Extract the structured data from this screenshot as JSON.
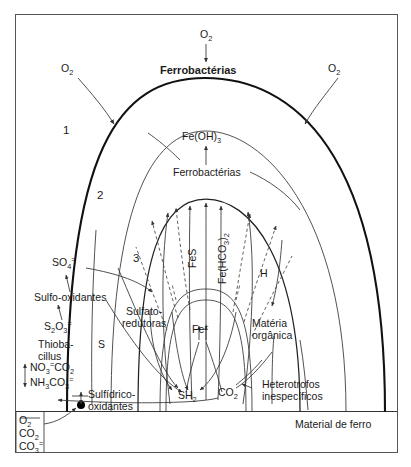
{
  "figure": {
    "title_label": "Ferrobactérias",
    "ground_label": "Material de ferro",
    "zones": [
      {
        "id": "zone-1",
        "label": "1"
      },
      {
        "id": "zone-2",
        "label": "2"
      },
      {
        "id": "zone-3",
        "label": "3"
      }
    ],
    "oxygen_inputs": [
      {
        "id": "o2-top",
        "label": "O",
        "sub": "2"
      },
      {
        "id": "o2-left",
        "label": "O",
        "sub": "2"
      },
      {
        "id": "o2-right",
        "label": "O",
        "sub": "2"
      }
    ],
    "species": [
      {
        "id": "fe-oh-3",
        "label": "Fe(OH)",
        "sub": "3"
      },
      {
        "id": "ferrobacterias-inner",
        "label": "Ferrobactérias"
      },
      {
        "id": "fes",
        "label": "FeS"
      },
      {
        "id": "fe-hco3-2",
        "label": "Fe(HCO",
        "sub": "3",
        "tail": ")",
        "sub2": "2"
      },
      {
        "id": "hydrogen",
        "label": "H"
      },
      {
        "id": "sulfate-ion",
        "label": "SO",
        "sub": "4",
        "sup": "="
      },
      {
        "id": "thiosulfate-ion",
        "label": "S",
        "sub": "2",
        "label2": "O",
        "sub2": "3",
        "sup": "="
      },
      {
        "id": "elemental-sulfur",
        "label": "S"
      },
      {
        "id": "ferrous-ion",
        "label": "Fe",
        "sup": "+"
      },
      {
        "id": "hydrogen-sulfide",
        "label": "SH",
        "sub": "2"
      },
      {
        "id": "carbon-dioxide",
        "label": "CO",
        "sub": "2"
      }
    ],
    "organisms": [
      {
        "id": "sulfo-oxidantes",
        "label": "Sulfo-oxidantes"
      },
      {
        "id": "thiobacillus",
        "line1": "Thioba-",
        "line2": "cillus"
      },
      {
        "id": "sulfidrico-oxidantes",
        "line1": "Sulfídrico-",
        "line2": "oxidantes"
      },
      {
        "id": "sulfato-redutoras",
        "line1": "Sulfato-",
        "line2": "redutoras"
      },
      {
        "id": "heterotrofos",
        "line1": "Heterotrofos",
        "line2": "inespecíficos"
      },
      {
        "id": "materia-organica",
        "line1": "Matéria",
        "line2": "orgânica"
      }
    ],
    "nitrogen_group": [
      {
        "id": "no3-co2",
        "label": "NO",
        "sub": "3",
        "sup": "=",
        "label2": "CO",
        "sub2": "2"
      },
      {
        "id": "nh3-co3",
        "label": "NH",
        "sub": "3",
        "label2": "CO",
        "sub2": "3",
        "sup2": "="
      }
    ],
    "corner_inputs": [
      {
        "id": "corner-o2",
        "label": "O",
        "sub": "2"
      },
      {
        "id": "corner-co2",
        "label": "CO",
        "sub": "2"
      },
      {
        "id": "corner-co3",
        "label": "CO",
        "sub": "3",
        "sup": "="
      }
    ],
    "colors": {
      "ink": "#111111",
      "line": "#333333",
      "frame": "#555555",
      "background": "#ffffff"
    }
  }
}
